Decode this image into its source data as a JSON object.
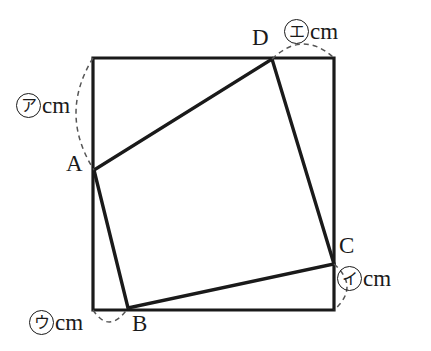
{
  "figure": {
    "canvas": {
      "width": 431,
      "height": 351
    },
    "stroke_color": "#1a1a1a",
    "dash_color": "#555555",
    "background": "#ffffff",
    "square": {
      "name": "outer-square",
      "top_left": [
        93,
        58
      ],
      "top_right": [
        334,
        58
      ],
      "bottom_right": [
        334,
        310
      ],
      "bottom_left": [
        93,
        310
      ],
      "stroke_width": 3.2
    },
    "quadrilateral": {
      "name": "inner-quadrilateral",
      "stroke_width": 3.4,
      "vertices": [
        {
          "id": "A",
          "x": 94,
          "y": 170,
          "on_edge": "left"
        },
        {
          "id": "B",
          "x": 128,
          "y": 308,
          "on_edge": "bottom"
        },
        {
          "id": "C",
          "x": 334,
          "y": 264,
          "on_edge": "right"
        },
        {
          "id": "D",
          "x": 272,
          "y": 59,
          "on_edge": "top"
        }
      ]
    },
    "vertex_labels": [
      {
        "id": "label-A",
        "text": "A",
        "x": 66,
        "y": 152
      },
      {
        "id": "label-B",
        "text": "B",
        "x": 132,
        "y": 312
      },
      {
        "id": "label-C",
        "text": "C",
        "x": 339,
        "y": 234
      },
      {
        "id": "label-D",
        "text": "D",
        "x": 252,
        "y": 26
      }
    ],
    "measures": [
      {
        "id": "measure-a",
        "marker": "ア",
        "marker_romaji": "a",
        "unit": "cm",
        "label_x": 16,
        "label_y": 93,
        "segment": "top-left-corner to A (left edge)",
        "arc": {
          "from": [
            93,
            58
          ],
          "to": [
            94,
            170
          ],
          "bulge": [
            76,
            114
          ]
        }
      },
      {
        "id": "measure-i",
        "marker": "イ",
        "marker_romaji": "i",
        "unit": "cm",
        "label_x": 337,
        "label_y": 266,
        "segment": "C to bottom-right corner (right edge)",
        "arc": {
          "from": [
            334,
            264
          ],
          "to": [
            334,
            310
          ],
          "bulge": [
            347,
            287
          ]
        }
      },
      {
        "id": "measure-u",
        "marker": "ウ",
        "marker_romaji": "u",
        "unit": "cm",
        "label_x": 29,
        "label_y": 310,
        "segment": "bottom-left corner to B (bottom edge)",
        "arc": {
          "from": [
            93,
            310
          ],
          "to": [
            128,
            308
          ],
          "bulge": [
            110,
            322
          ]
        }
      },
      {
        "id": "measure-e",
        "marker": "エ",
        "marker_romaji": "e",
        "unit": "cm",
        "label_x": 284,
        "label_y": 19,
        "segment": "D to top-right corner (top edge)",
        "arc": {
          "from": [
            272,
            59
          ],
          "to": [
            334,
            58
          ],
          "bulge": [
            303,
            44
          ]
        }
      }
    ]
  }
}
